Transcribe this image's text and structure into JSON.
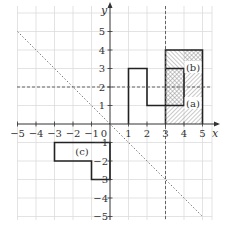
{
  "diagram": {
    "type": "coordinate-grid-transformations",
    "axes": {
      "x_label": "x",
      "y_label": "y",
      "x_ticks": [
        "−5",
        "−4",
        "−3",
        "−2",
        "−1",
        "0",
        "1",
        "2",
        "3",
        "4",
        "5"
      ],
      "y_ticks": [
        "5",
        "4",
        "3",
        "2",
        "1",
        "−1",
        "−2",
        "−3",
        "−4",
        "−5"
      ],
      "x_range": [
        -5,
        5
      ],
      "y_range": [
        -5,
        5
      ]
    },
    "mirror_lines": [
      {
        "name": "y = 2",
        "style": "dashed"
      },
      {
        "name": "x = 3",
        "style": "dashed"
      },
      {
        "name": "y = -x",
        "style": "dotted"
      }
    ],
    "shapes": [
      {
        "name": "original",
        "label": "",
        "vertices": [
          [
            1,
            0
          ],
          [
            1,
            3
          ],
          [
            2,
            3
          ],
          [
            2,
            1
          ],
          [
            3,
            1
          ],
          [
            3,
            0
          ]
        ]
      },
      {
        "name": "a",
        "label": "(a)",
        "hatched": true,
        "vertices": [
          [
            3,
            0
          ],
          [
            3,
            3
          ],
          [
            4,
            3
          ],
          [
            4,
            4
          ],
          [
            5,
            4
          ],
          [
            5,
            0
          ]
        ]
      },
      {
        "name": "b",
        "label": "(b)",
        "hatched": true,
        "vertices": [
          [
            3,
            4
          ],
          [
            3,
            1
          ],
          [
            4,
            1
          ],
          [
            4,
            3
          ],
          [
            5,
            3
          ],
          [
            5,
            4
          ]
        ]
      },
      {
        "name": "c",
        "label": "(c)",
        "hatched": false,
        "vertices": [
          [
            -3,
            -1
          ],
          [
            -3,
            -2
          ],
          [
            -1,
            -2
          ],
          [
            -1,
            -3
          ],
          [
            0,
            -3
          ],
          [
            0,
            -1
          ]
        ]
      }
    ],
    "colors": {
      "grid": "#d8d8d8",
      "axis": "#333333",
      "shape_outline": "#222222",
      "hatch": "#888888",
      "dashed": "#555555"
    }
  }
}
